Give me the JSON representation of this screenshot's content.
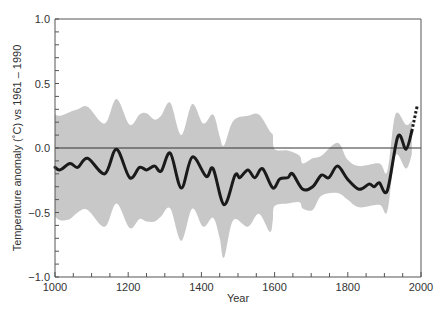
{
  "chart_data": {
    "type": "line",
    "title": "",
    "xlabel": "Year",
    "ylabel": "Temperature anomaly (˚C) vs 1961 – 1990",
    "xlim": [
      1000,
      2000
    ],
    "ylim": [
      -1.0,
      1.0
    ],
    "x_ticks": [
      1000,
      1200,
      1400,
      1600,
      1800,
      2000
    ],
    "x_tick_labels": [
      "1000",
      "1200",
      "1400",
      "1600",
      "1800",
      "2000"
    ],
    "x_minor_step": 50,
    "y_ticks": [
      -1.0,
      -0.5,
      0.0,
      0.5,
      1.0
    ],
    "y_tick_labels": [
      "−1.0",
      "−0.5",
      "0.0",
      "0.5",
      "1.0"
    ],
    "y_minor_step": 0.1,
    "grid": false,
    "legend": null,
    "reference_line": 0.0,
    "colors": {
      "line": "#1a1a1a",
      "band": "#c8c8c8",
      "axis": "#555555"
    },
    "series": [
      {
        "name": "Reconstructed temperature (smoothed)",
        "style": "solid",
        "x": [
          1000,
          1014,
          1041,
          1062,
          1089,
          1136,
          1168,
          1204,
          1231,
          1250,
          1272,
          1290,
          1315,
          1345,
          1375,
          1413,
          1432,
          1462,
          1492,
          1505,
          1527,
          1546,
          1567,
          1595,
          1614,
          1636,
          1649,
          1677,
          1704,
          1728,
          1748,
          1772,
          1799,
          1831,
          1858,
          1872,
          1886,
          1908,
          1937,
          1959,
          1975
        ],
        "values": [
          -0.15,
          -0.17,
          -0.12,
          -0.15,
          -0.08,
          -0.2,
          -0.01,
          -0.23,
          -0.15,
          -0.17,
          -0.14,
          -0.18,
          -0.04,
          -0.31,
          -0.07,
          -0.22,
          -0.16,
          -0.44,
          -0.21,
          -0.23,
          -0.17,
          -0.23,
          -0.16,
          -0.31,
          -0.24,
          -0.23,
          -0.2,
          -0.32,
          -0.3,
          -0.21,
          -0.23,
          -0.14,
          -0.24,
          -0.32,
          -0.28,
          -0.3,
          -0.27,
          -0.33,
          0.09,
          -0.01,
          0.13
        ]
      },
      {
        "name": "Instrumental record",
        "style": "dotted",
        "x": [
          1975,
          1980,
          1986,
          1990
        ],
        "values": [
          0.13,
          0.2,
          0.28,
          0.33
        ]
      }
    ],
    "uncertainty_band": {
      "name": "Uncertainty range",
      "x": [
        1000,
        1014,
        1041,
        1062,
        1089,
        1136,
        1168,
        1204,
        1231,
        1250,
        1272,
        1290,
        1315,
        1345,
        1375,
        1405,
        1432,
        1450,
        1462,
        1487,
        1527,
        1557,
        1587,
        1595,
        1600,
        1636,
        1668,
        1677,
        1704,
        1728,
        1772,
        1799,
        1831,
        1886,
        1908,
        1930,
        1959,
        1975
      ],
      "upper": [
        0.26,
        0.25,
        0.28,
        0.3,
        0.32,
        0.19,
        0.38,
        0.18,
        0.26,
        0.27,
        0.22,
        0.25,
        0.35,
        0.1,
        0.34,
        0.19,
        0.26,
        0.09,
        0.02,
        0.21,
        0.25,
        0.26,
        0.13,
        0.1,
        -0.01,
        -0.02,
        -0.06,
        -0.12,
        -0.08,
        -0.06,
        0.04,
        -0.09,
        -0.14,
        -0.12,
        -0.18,
        0.26,
        0.18,
        0.21
      ],
      "lower": [
        -0.53,
        -0.56,
        -0.55,
        -0.5,
        -0.48,
        -0.61,
        -0.43,
        -0.62,
        -0.55,
        -0.57,
        -0.57,
        -0.53,
        -0.47,
        -0.72,
        -0.47,
        -0.61,
        -0.54,
        -0.7,
        -0.85,
        -0.56,
        -0.61,
        -0.51,
        -0.65,
        -0.56,
        -0.45,
        -0.43,
        -0.42,
        -0.47,
        -0.48,
        -0.37,
        -0.35,
        -0.4,
        -0.46,
        -0.44,
        -0.49,
        -0.06,
        -0.16,
        -0.05
      ]
    }
  }
}
